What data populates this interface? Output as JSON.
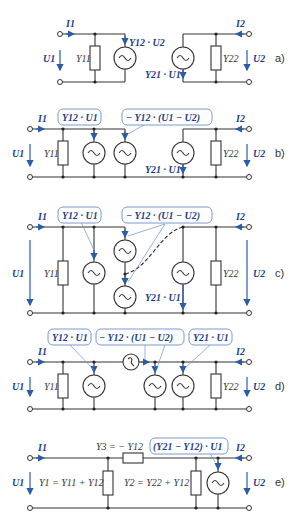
{
  "panels": [
    {
      "id": "a",
      "label": "a)",
      "I1": "I1",
      "I2": "I2",
      "U1": "U1",
      "U2": "U2",
      "Y11": "Y11",
      "Y22": "Y22",
      "src1": "Y12 · U2",
      "src2": "Y21 · U1"
    },
    {
      "id": "b",
      "label": "b)",
      "I1": "I1",
      "I2": "I2",
      "U1": "U1",
      "U2": "U2",
      "Y11": "Y11",
      "Y22": "Y22",
      "box1": "Y12 · U1",
      "box2": "− Y12 · (U1 − U2)",
      "src": "Y21 · U1"
    },
    {
      "id": "c",
      "label": "c)",
      "I1": "I1",
      "I2": "I2",
      "U1": "U1",
      "U2": "U2",
      "Y11": "Y11",
      "Y22": "Y22",
      "box1": "Y12 · U1",
      "box2": "− Y12 · (U1 − U2)",
      "src": "Y21 · U1"
    },
    {
      "id": "d",
      "label": "d)",
      "I1": "I1",
      "I2": "I2",
      "U1": "U1",
      "U2": "U2",
      "Y11": "Y11",
      "Y22": "Y22",
      "box1": "Y12 · U1",
      "box2": "− Y12 · (U1 − U2)",
      "box3": "Y21 · U1"
    },
    {
      "id": "e",
      "label": "e)",
      "I1": "I1",
      "I2": "I2",
      "U1": "U1",
      "U2": "U2",
      "Y3": "Y3 = − Y12",
      "Y1": "Y1 = Y11 + Y12",
      "Y2": "Y2 = Y22 + Y12",
      "box": "(Y21 − Y12) · U1"
    }
  ],
  "colors": {
    "accent": "#2a5ca8",
    "wire": "#333333",
    "box_border": "#6d8fc7"
  }
}
